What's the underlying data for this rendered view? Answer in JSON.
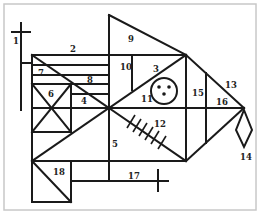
{
  "figure": {
    "type": "line-drawing figure (complex geometric figure)",
    "stroke_color": "#1a1a1a",
    "background": "#ffffff",
    "labels": [
      {
        "id": "1",
        "text": "1",
        "x": 13,
        "y": 44
      },
      {
        "id": "2",
        "text": "2",
        "x": 70,
        "y": 52
      },
      {
        "id": "3",
        "text": "3",
        "x": 153,
        "y": 72
      },
      {
        "id": "4",
        "text": "4",
        "x": 81,
        "y": 104
      },
      {
        "id": "5",
        "text": "5",
        "x": 112,
        "y": 147
      },
      {
        "id": "6",
        "text": "6",
        "x": 48,
        "y": 97
      },
      {
        "id": "7",
        "text": "7",
        "x": 38,
        "y": 76
      },
      {
        "id": "8",
        "text": "8",
        "x": 87,
        "y": 83
      },
      {
        "id": "9",
        "text": "9",
        "x": 128,
        "y": 42
      },
      {
        "id": "10",
        "text": "10",
        "x": 120,
        "y": 70
      },
      {
        "id": "11",
        "text": "11",
        "x": 141,
        "y": 102
      },
      {
        "id": "12",
        "text": "12",
        "x": 154,
        "y": 127
      },
      {
        "id": "13",
        "text": "13",
        "x": 225,
        "y": 88
      },
      {
        "id": "14",
        "text": "14",
        "x": 240,
        "y": 160
      },
      {
        "id": "15",
        "text": "15",
        "x": 192,
        "y": 96
      },
      {
        "id": "16",
        "text": "16",
        "x": 216,
        "y": 105
      },
      {
        "id": "17",
        "text": "17",
        "x": 128,
        "y": 179
      },
      {
        "id": "18",
        "text": "18",
        "x": 53,
        "y": 175
      }
    ]
  }
}
